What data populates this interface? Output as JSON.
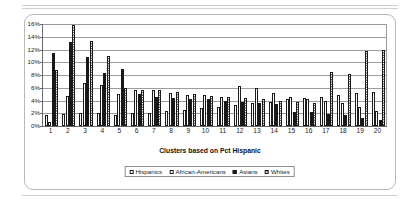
{
  "chart_data": {
    "type": "bar",
    "title": "",
    "xlabel": "Clusters based on Pct Hispanic",
    "ylabel": "",
    "ylim": [
      0,
      16
    ],
    "ytick_labels": [
      "0%",
      "2%",
      "4%",
      "6%",
      "8%",
      "10%",
      "12%",
      "14%",
      "16%"
    ],
    "ytick_values": [
      0,
      2,
      4,
      6,
      8,
      10,
      12,
      14,
      16
    ],
    "grid": true,
    "legend_position": "bottom",
    "categories": [
      "1",
      "2",
      "3",
      "4",
      "5",
      "6",
      "7",
      "8",
      "9",
      "10",
      "11",
      "12",
      "13",
      "14",
      "15",
      "16",
      "17",
      "18",
      "19",
      "20"
    ],
    "series": [
      {
        "name": "Hispanics",
        "pattern": "dotted",
        "values": [
          1.8,
          1.9,
          2.0,
          2.0,
          1.8,
          2.0,
          2.1,
          2.3,
          2.5,
          2.8,
          3.0,
          3.3,
          3.6,
          3.8,
          4.2,
          4.4,
          4.6,
          4.9,
          5.2,
          5.4
        ]
      },
      {
        "name": "African-Americans",
        "pattern": "plain",
        "values": [
          0.6,
          4.7,
          6.7,
          6.5,
          5.0,
          5.6,
          5.6,
          5.2,
          4.9,
          4.8,
          4.6,
          6.2,
          6.0,
          5.2,
          4.6,
          4.2,
          4.0,
          3.6,
          3.0,
          2.4
        ]
      },
      {
        "name": "Asians",
        "pattern": "solid",
        "values": [
          11.4,
          13.2,
          10.8,
          8.3,
          9.0,
          5.1,
          4.5,
          4.4,
          4.3,
          4.2,
          3.9,
          3.7,
          3.6,
          3.5,
          2.2,
          2.2,
          1.9,
          1.7,
          1.3,
          0.9
        ]
      },
      {
        "name": "Whites",
        "pattern": "checkered",
        "values": [
          8.8,
          15.8,
          13.4,
          11.0,
          6.0,
          5.6,
          5.6,
          5.4,
          5.0,
          4.7,
          4.6,
          4.4,
          4.3,
          4.0,
          3.8,
          3.6,
          8.4,
          8.2,
          11.8,
          11.9
        ]
      }
    ]
  },
  "legend": {
    "items": [
      {
        "label": "Hispanics"
      },
      {
        "label": "African-Americans"
      },
      {
        "label": "Asians"
      },
      {
        "label": "Whites"
      }
    ]
  }
}
